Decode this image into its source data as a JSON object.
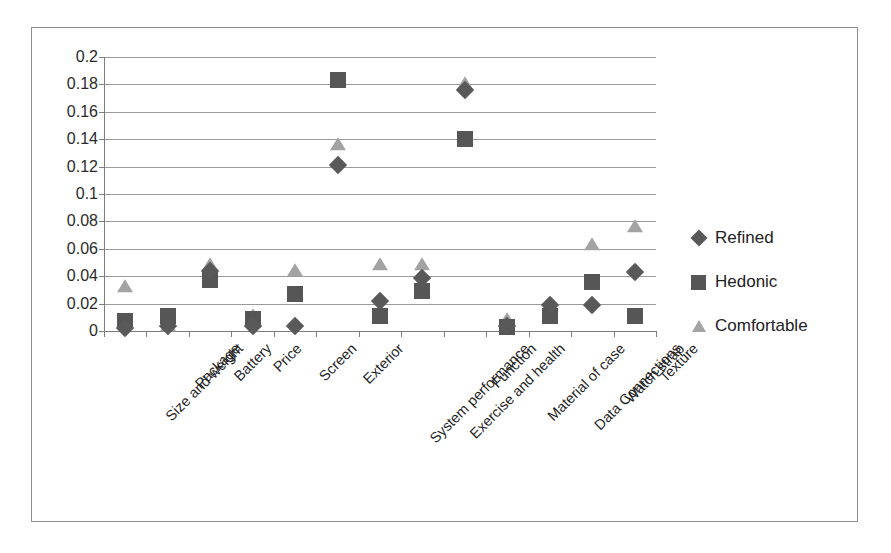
{
  "chart_data": {
    "type": "scatter",
    "title": "",
    "xlabel": "",
    "ylabel": "",
    "ylim": [
      0,
      0.2
    ],
    "ytick_step": 0.02,
    "yticks": [
      "0.2",
      "0.18",
      "0.16",
      "0.14",
      "0.12",
      "0.1",
      "0.08",
      "0.06",
      "0.04",
      "0.02",
      "0"
    ],
    "grid": true,
    "legend_position": "right",
    "categories": [
      "Size and weight",
      "Package",
      "Battery",
      "Price",
      "Screen",
      "Exterior",
      "System performance",
      "Exercise and health",
      "Function",
      "Material of case",
      "Data Connections",
      "Watch strap",
      "Texture"
    ],
    "series": [
      {
        "name": "Refined",
        "marker": "diamond",
        "color": "#595959",
        "values": [
          0.002,
          0.004,
          0.044,
          0.004,
          0.004,
          0.121,
          0.022,
          0.039,
          0.176,
          0.004,
          0.019,
          0.019,
          0.043
        ]
      },
      {
        "name": "Hedonic",
        "marker": "square",
        "color": "#565656",
        "values": [
          0.007,
          0.011,
          0.037,
          0.009,
          0.027,
          0.183,
          0.011,
          0.029,
          0.14,
          0.003,
          0.011,
          0.036,
          0.011
        ]
      },
      {
        "name": "Comfortable",
        "marker": "triangle",
        "color": "#a3a3a3",
        "values": [
          0.032,
          0.004,
          0.048,
          0.011,
          0.044,
          0.136,
          0.048,
          0.048,
          0.18,
          0.008,
          0.019,
          0.063,
          0.076
        ]
      }
    ]
  },
  "legend": {
    "items": [
      {
        "label": "Refined",
        "marker": "diamond-marker-icon"
      },
      {
        "label": "Hedonic",
        "marker": "square-marker-icon"
      },
      {
        "label": "Comfortable",
        "marker": "triangle-marker-icon"
      }
    ]
  }
}
